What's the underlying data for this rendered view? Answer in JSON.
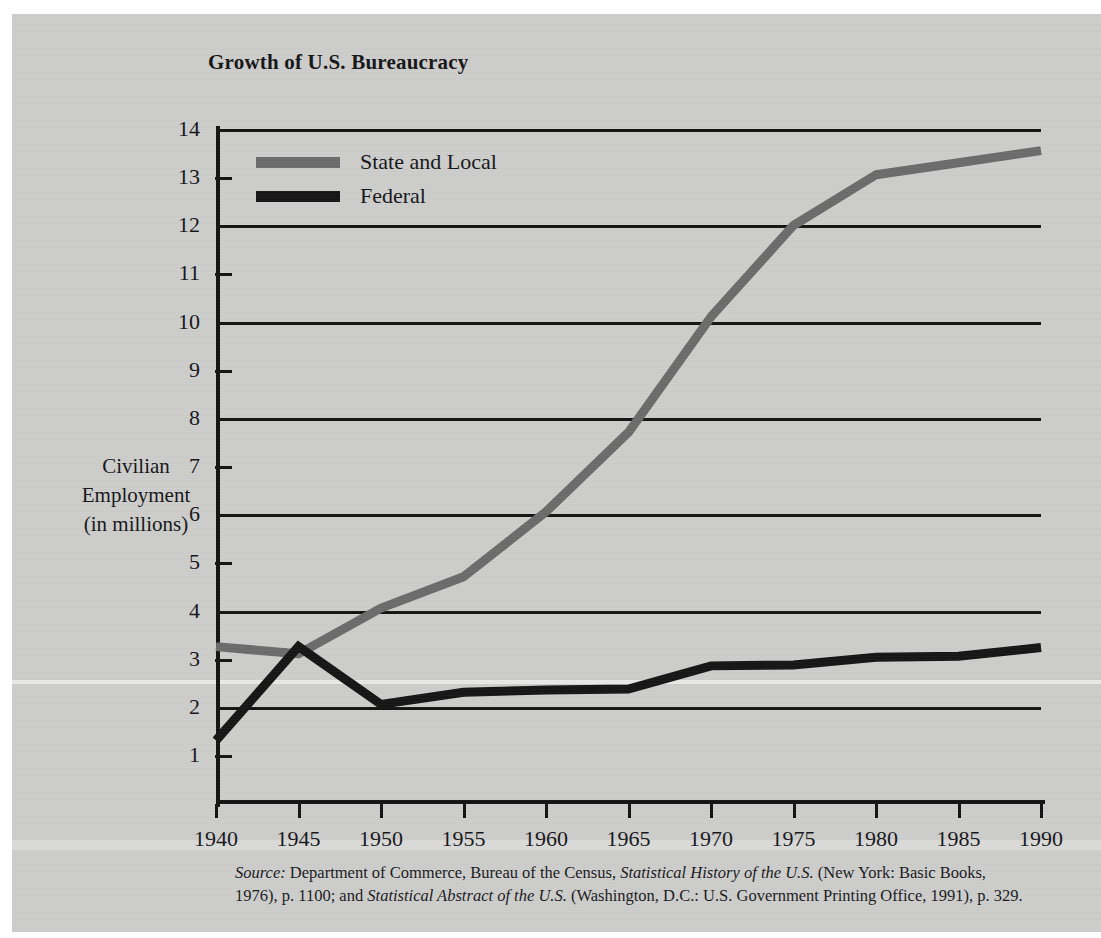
{
  "figure": {
    "title": "Growth of U.S. Bureaucracy",
    "background_color": "#cdcdcb"
  },
  "axis_title": {
    "line1": "Civilian",
    "line2": "Employment",
    "line3": "(in millions)"
  },
  "legend": {
    "items": [
      {
        "label": "State and Local",
        "color": "#6c6c6c"
      },
      {
        "label": "Federal",
        "color": "#161616"
      }
    ]
  },
  "source_note": {
    "label": "Source:",
    "text_1": " Department of Commerce, Bureau of the Census, ",
    "italic_1": "Statistical History of the U.S.",
    "text_2": " (New York: Basic Books, 1976), p. 1100; and ",
    "italic_2": "Statistical Abstract of the U.S.",
    "text_3": " (Washington, D.C.: U.S. Government Printing Office, 1991), p. 329."
  },
  "chart_data": {
    "type": "line",
    "title": "Growth of U.S. Bureaucracy",
    "xlabel": "",
    "ylabel": "Civilian Employment (in millions)",
    "x": [
      1940,
      1945,
      1950,
      1955,
      1960,
      1965,
      1970,
      1975,
      1980,
      1985,
      1990
    ],
    "xtick_labels": [
      "1940",
      "1945",
      "1950",
      "1955",
      "1960",
      "1965",
      "1970",
      "1975",
      "1980",
      "1985",
      "1990"
    ],
    "xlim": [
      1940,
      1990
    ],
    "ylim": [
      0,
      14
    ],
    "ytick_labels": [
      "14",
      "13",
      "12",
      "11",
      "10",
      "9",
      "8",
      "7",
      "6",
      "5",
      "4",
      "3",
      "2",
      "1"
    ],
    "yticks": [
      14,
      13,
      12,
      11,
      10,
      9,
      8,
      7,
      6,
      5,
      4,
      3,
      2,
      1
    ],
    "gridline_values": [
      14,
      12,
      10,
      8,
      6,
      4,
      2
    ],
    "tickmark_values": [
      13,
      11,
      9,
      7,
      5,
      3,
      1
    ],
    "grid": true,
    "legend_position": "upper left",
    "series": [
      {
        "name": "State and Local",
        "color": "#6c6c6c",
        "values": [
          3.25,
          3.1,
          4.05,
          4.7,
          6.05,
          7.7,
          10.1,
          12.0,
          13.05,
          13.3,
          13.55
        ]
      },
      {
        "name": "Federal",
        "color": "#161616",
        "values": [
          1.3,
          3.25,
          2.05,
          2.3,
          2.35,
          2.37,
          2.85,
          2.87,
          3.03,
          3.05,
          3.23
        ]
      }
    ]
  }
}
